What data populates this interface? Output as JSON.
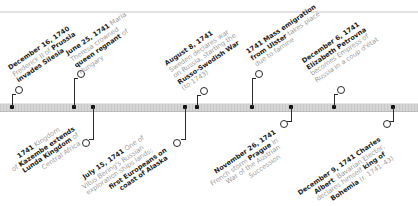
{
  "timeline": {
    "above": [
      {
        "date": "December 16, 1740",
        "l1": "Frederick II of ",
        "l1b": "Prussia",
        "l2b": "invades Silesia",
        "l3": ""
      },
      {
        "date": "June 25, 1741",
        "l0": " Maria",
        "l1": "Theresa crowned",
        "l2b": "queen regnant",
        "l2": " of",
        "l3": "Hungary"
      },
      {
        "date": "August 8, 1741",
        "l1": "Sweden declares war",
        "l2": "on Russia, starting the",
        "l3b": "Russo-Swedish War",
        "l4": "(to 1743)"
      },
      {
        "date": "1741",
        "l0b": " Mass emigration",
        "l1b": "from Ulster",
        "l1": " takes place",
        "l2": "due to famine"
      },
      {
        "date": "December 6, 1741",
        "l1b": "Elizabeth Petrovna",
        "l2": "becomes Empress of",
        "l3": "Russia in a coup d'état"
      }
    ],
    "below": [
      {
        "date": "1741",
        "l0": " Kingdom",
        "l1": "of ",
        "l1b": "Kazembe extends",
        "l2b": "Lunda Kingdom",
        "l2": " of",
        "l3": "Central Africa"
      },
      {
        "date": "July 15, 1741",
        "l0": " One of",
        "l1": "Vitus Bering's Russian",
        "l2": "exploration ships lands;",
        "l3b": "first Europeans on",
        "l4b": "coast of Alaska"
      },
      {
        "date": "November 26, 1741",
        "l1": "French storm ",
        "l1b": "Prague",
        "l1c": " in",
        "l2": "War of the Austrian",
        "l3": "Succession"
      },
      {
        "date": "December 9, 1741",
        "l0b": " Charles",
        "l1b": "Albert",
        "l1": ", Bavarian Elector,",
        "l2": "declares himself ",
        "l2b": "king of",
        "l3b": "Bohemia",
        "l3": " (r. 1741–43)"
      }
    ]
  },
  "colors": {
    "text_dark": "#1e1e1e",
    "text_light": "#9c9c9c",
    "axis": "#cfcfcf"
  }
}
